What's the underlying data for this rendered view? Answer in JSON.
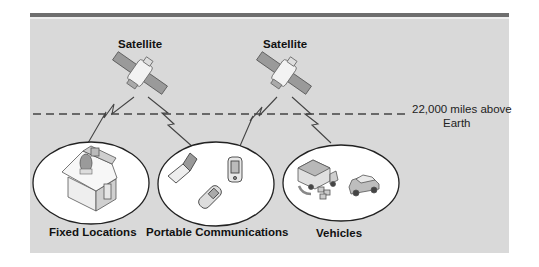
{
  "diagram": {
    "colors": {
      "background": "#d9d9d9",
      "top_band": "#6e6e6e",
      "orbit_line": "#444444",
      "ellipse_fill": "#ffffff",
      "text": "#111111"
    },
    "satellites": [
      {
        "label": "Satellite",
        "icon": "satellite-icon"
      },
      {
        "label": "Satellite",
        "icon": "satellite-icon"
      }
    ],
    "orbit": {
      "line1": "22,000 miles above",
      "line2": "Earth",
      "style": "dashed"
    },
    "groups": [
      {
        "label": "Fixed Locations",
        "icons": [
          "house-icon",
          "satellite-dish-icon"
        ]
      },
      {
        "label": "Portable Communications",
        "icons": [
          "laptop-icon",
          "pda-icon",
          "mobile-phone-icon"
        ]
      },
      {
        "label": "Vehicles",
        "icons": [
          "delivery-truck-icon",
          "car-icon"
        ]
      }
    ]
  }
}
